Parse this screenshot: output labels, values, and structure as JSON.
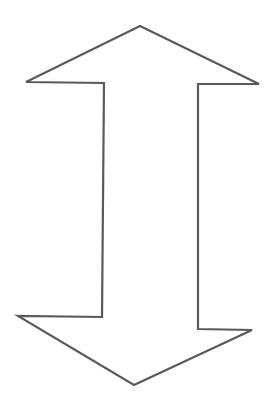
{
  "diagram": {
    "shape": "double-headed-vertical-arrow",
    "stroke_color": "#5a5a5a",
    "fill_color": "#ffffff",
    "stroke_width": 2.2,
    "points": "140,26 259,84 198,84 198,329 252,330 134,385 18,316 102,317 104,83 26,82"
  }
}
